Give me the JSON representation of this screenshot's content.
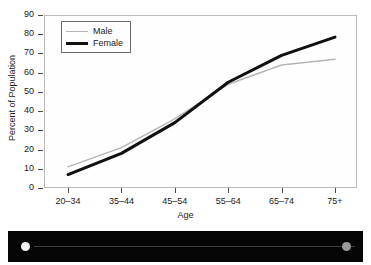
{
  "chart_data": {
    "type": "line",
    "title": "",
    "xlabel": "Age",
    "ylabel": "Percent of Population",
    "categories": [
      "20–34",
      "35–44",
      "45–54",
      "55–64",
      "65–74",
      "75+"
    ],
    "series": [
      {
        "name": "Male",
        "color": "#b5b5b5",
        "line_width": 1.5,
        "values": [
          11,
          21,
          36,
          54,
          64,
          67
        ]
      },
      {
        "name": "Female",
        "color": "#101010",
        "line_width": 3,
        "values": [
          7,
          18,
          34,
          55,
          69,
          78.5
        ]
      }
    ],
    "ylim": [
      0,
      90
    ],
    "yticks": [
      0,
      10,
      20,
      30,
      40,
      50,
      60,
      70,
      80,
      90
    ],
    "ytick_labels": [
      "0",
      "10",
      "20",
      "30",
      "40",
      "50",
      "60",
      "70",
      "80",
      "90"
    ],
    "grid": false,
    "legend_position": "upper left"
  },
  "legend": {
    "entries": [
      {
        "label": "Male"
      },
      {
        "label": "Female"
      }
    ]
  },
  "axes": {
    "x_title": "Age",
    "y_title": "Percent of Population"
  },
  "bottom_band": {
    "left_dot_color": "#f2f2f2",
    "right_dot_color": "#9a9a9a",
    "band_color": "#050505"
  }
}
